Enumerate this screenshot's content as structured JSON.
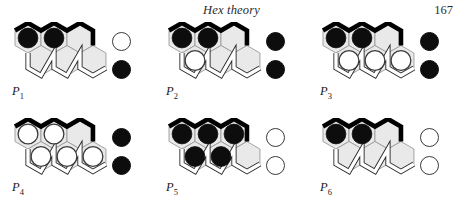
{
  "header": {
    "title": "Hex theory",
    "page_number": "167"
  },
  "figure": {
    "board": {
      "rows": 2,
      "cols": 3,
      "shape": "rhombus",
      "cell_fill": "#e9e9e9",
      "cell_stroke": "#9a9a9a",
      "black_edge_color": "#000000",
      "white_edge_color": "#ffffff",
      "white_edge_outline": "#2a2a2a",
      "cell_order": [
        "top-left",
        "top-middle",
        "top-right",
        "bottom-left",
        "bottom-middle",
        "bottom-right"
      ]
    },
    "stone_colors": {
      "black": "#0d0d0d",
      "white": "#ffffff"
    },
    "panels": [
      {
        "id": "P1",
        "label": "P",
        "subscript": "1",
        "cells": [
          "black",
          "black",
          "empty",
          "empty",
          "empty",
          "empty"
        ],
        "legend": [
          "white",
          "black"
        ]
      },
      {
        "id": "P2",
        "label": "P",
        "subscript": "2",
        "cells": [
          "black",
          "black",
          "empty",
          "white",
          "empty",
          "empty"
        ],
        "legend": [
          "black",
          "black"
        ]
      },
      {
        "id": "P3",
        "label": "P",
        "subscript": "3",
        "cells": [
          "black",
          "black",
          "empty",
          "white",
          "white",
          "white"
        ],
        "legend": [
          "black",
          "black"
        ]
      },
      {
        "id": "P4",
        "label": "P",
        "subscript": "4",
        "cells": [
          "white",
          "white",
          "empty",
          "white",
          "white",
          "white"
        ],
        "legend": [
          "black",
          "black"
        ]
      },
      {
        "id": "P5",
        "label": "P",
        "subscript": "5",
        "cells": [
          "black",
          "black",
          "black",
          "black",
          "black",
          "empty"
        ],
        "legend": [
          "white",
          "white"
        ]
      },
      {
        "id": "P6",
        "label": "P",
        "subscript": "6",
        "cells": [
          "black",
          "black",
          "empty",
          "empty",
          "empty",
          "empty"
        ],
        "legend": [
          "white",
          "white"
        ]
      }
    ]
  }
}
